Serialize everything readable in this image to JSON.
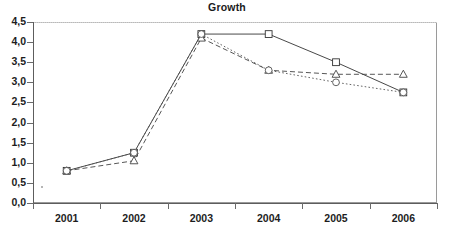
{
  "chart_data": {
    "type": "line",
    "title": "Growth",
    "xlabel": "",
    "ylabel": "",
    "categories": [
      "2001",
      "2002",
      "2003",
      "2004",
      "2005",
      "2006"
    ],
    "x_tick_labels": [
      "2001",
      "2002",
      "2003",
      "2004",
      "2005",
      "2006"
    ],
    "y_tick_labels": [
      "0,0",
      "0,5",
      "1,0",
      "1,5",
      "2,0",
      "2,5",
      "3,0",
      "3,5",
      "4,0",
      "4,5"
    ],
    "y_tick_values": [
      0.0,
      0.5,
      1.0,
      1.5,
      2.0,
      2.5,
      3.0,
      3.5,
      4.0,
      4.5
    ],
    "ylim": [
      0.0,
      4.5
    ],
    "grid": false,
    "legend": "none",
    "decimal_separator": ",",
    "series": [
      {
        "name": "series-square-solid",
        "marker": "square",
        "line_style": "solid",
        "color": "#333333",
        "values": [
          0.8,
          1.25,
          4.2,
          4.2,
          3.5,
          2.75
        ]
      },
      {
        "name": "series-triangle-dashed",
        "marker": "triangle",
        "line_style": "dashed",
        "color": "#444444",
        "values": [
          0.8,
          1.05,
          4.1,
          3.3,
          3.2,
          3.2
        ]
      },
      {
        "name": "series-circle-dotted",
        "marker": "circle",
        "line_style": "dotted",
        "color": "#555555",
        "values": [
          0.8,
          1.25,
          4.2,
          3.3,
          3.0,
          2.75
        ]
      }
    ]
  }
}
